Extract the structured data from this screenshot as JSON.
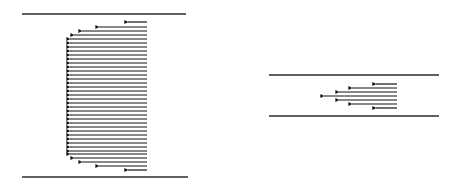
{
  "diagram": {
    "colors": {
      "line": "#2b2b2b",
      "arrow": "#111111",
      "background": "#ffffff"
    },
    "left_panel": {
      "walls": [
        {
          "x1": 22,
          "x2": 186,
          "y": 14
        },
        {
          "x1": 22,
          "x2": 188,
          "y": 177
        }
      ],
      "arrow_tail_x": 147,
      "arrows": [
        {
          "y": 22,
          "tip_x": 124
        },
        {
          "y": 27,
          "tip_x": 95
        },
        {
          "y": 31,
          "tip_x": 78
        },
        {
          "y": 35,
          "tip_x": 70
        },
        {
          "y": 39,
          "tip_x": 66
        },
        {
          "y": 43,
          "tip_x": 66
        },
        {
          "y": 47,
          "tip_x": 66
        },
        {
          "y": 51,
          "tip_x": 66
        },
        {
          "y": 55,
          "tip_x": 66
        },
        {
          "y": 59,
          "tip_x": 66
        },
        {
          "y": 63,
          "tip_x": 66
        },
        {
          "y": 67,
          "tip_x": 66
        },
        {
          "y": 71,
          "tip_x": 66
        },
        {
          "y": 75,
          "tip_x": 66
        },
        {
          "y": 79,
          "tip_x": 66
        },
        {
          "y": 83,
          "tip_x": 66
        },
        {
          "y": 87,
          "tip_x": 66
        },
        {
          "y": 91,
          "tip_x": 66
        },
        {
          "y": 95,
          "tip_x": 66
        },
        {
          "y": 99,
          "tip_x": 66
        },
        {
          "y": 103,
          "tip_x": 66
        },
        {
          "y": 107,
          "tip_x": 66
        },
        {
          "y": 111,
          "tip_x": 66
        },
        {
          "y": 115,
          "tip_x": 66
        },
        {
          "y": 119,
          "tip_x": 66
        },
        {
          "y": 123,
          "tip_x": 66
        },
        {
          "y": 127,
          "tip_x": 66
        },
        {
          "y": 131,
          "tip_x": 66
        },
        {
          "y": 135,
          "tip_x": 66
        },
        {
          "y": 139,
          "tip_x": 66
        },
        {
          "y": 143,
          "tip_x": 66
        },
        {
          "y": 147,
          "tip_x": 66
        },
        {
          "y": 151,
          "tip_x": 66
        },
        {
          "y": 154,
          "tip_x": 66
        },
        {
          "y": 158,
          "tip_x": 70
        },
        {
          "y": 162,
          "tip_x": 78
        },
        {
          "y": 166,
          "tip_x": 95
        },
        {
          "y": 170,
          "tip_x": 124
        }
      ]
    },
    "right_panel": {
      "walls": [
        {
          "x1": 269,
          "x2": 439,
          "y": 75
        },
        {
          "x1": 269,
          "x2": 439,
          "y": 116
        }
      ],
      "arrow_tail_x": 397,
      "arrows": [
        {
          "y": 84,
          "tip_x": 372
        },
        {
          "y": 88,
          "tip_x": 348
        },
        {
          "y": 92,
          "tip_x": 335
        },
        {
          "y": 96,
          "tip_x": 320
        },
        {
          "y": 100,
          "tip_x": 335
        },
        {
          "y": 104,
          "tip_x": 348
        },
        {
          "y": 108,
          "tip_x": 372
        }
      ]
    }
  }
}
